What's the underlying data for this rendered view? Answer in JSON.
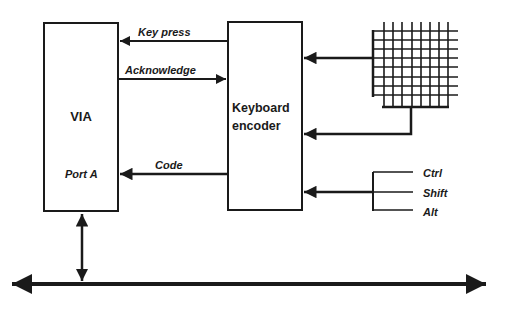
{
  "diagram": {
    "blocks": {
      "via": {
        "label": "VIA",
        "port_label": "Port A"
      },
      "encoder": {
        "label_line1": "Keyboard",
        "label_line2": "encoder"
      }
    },
    "signals": {
      "key_press": "Key press",
      "acknowledge": "Acknowledge",
      "code": "Code"
    },
    "modifiers": [
      "Ctrl",
      "Shift",
      "Alt"
    ],
    "colors": {
      "ink": "#1a1a1a",
      "background": "#ffffff"
    }
  }
}
